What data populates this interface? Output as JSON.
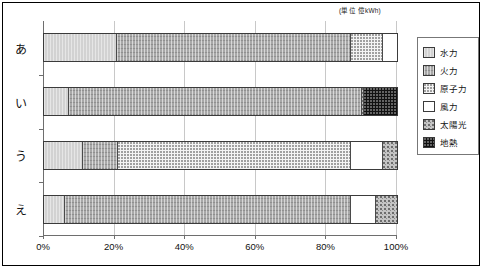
{
  "unit_caption": "(単位  億kWh)",
  "legend": {
    "items": [
      {
        "label": "水力",
        "key": "hydro"
      },
      {
        "label": "火力",
        "key": "thermal"
      },
      {
        "label": "原子力",
        "key": "nuclear"
      },
      {
        "label": "風力",
        "key": "wind"
      },
      {
        "label": "太陽光",
        "key": "solar"
      },
      {
        "label": "地熱",
        "key": "geothermal"
      }
    ]
  },
  "chart_data": {
    "type": "bar",
    "orientation": "horizontal",
    "stacked": true,
    "normalized": true,
    "title": "",
    "subtitle": "",
    "xlabel": "",
    "ylabel": "",
    "unit": "(単位  億kWh)",
    "xlim": [
      0,
      100
    ],
    "xticks": [
      0,
      20,
      40,
      60,
      80,
      100
    ],
    "xtick_labels": [
      "0%",
      "20%",
      "40%",
      "60%",
      "80%",
      "100%"
    ],
    "grid": true,
    "legend_position": "right",
    "categories": [
      "あ",
      "い",
      "う",
      "え"
    ],
    "series": [
      {
        "name": "水力",
        "key": "hydro",
        "values": [
          20.7,
          7.0,
          11.0,
          6.0
        ]
      },
      {
        "name": "火力",
        "key": "thermal",
        "values": [
          66.3,
          83.0,
          10.0,
          81.0
        ]
      },
      {
        "name": "原子力",
        "key": "nuclear",
        "values": [
          9.0,
          0.0,
          66.0,
          0.0
        ]
      },
      {
        "name": "風力",
        "key": "wind",
        "values": [
          4.0,
          0.0,
          9.0,
          7.0
        ]
      },
      {
        "name": "太陽光",
        "key": "solar",
        "values": [
          0.0,
          0.6,
          4.0,
          6.0
        ]
      },
      {
        "name": "地熱",
        "key": "geothermal",
        "values": [
          0.0,
          9.4,
          0.0,
          0.0
        ]
      }
    ],
    "bars": [
      {
        "category": "あ",
        "segments": [
          {
            "key": "hydro",
            "label": "水力",
            "start": 0.0,
            "end": 20.7,
            "value": 20.7
          },
          {
            "key": "thermal",
            "label": "火力",
            "start": 20.7,
            "end": 87.0,
            "value": 66.3
          },
          {
            "key": "nuclear",
            "label": "原子力",
            "start": 87.0,
            "end": 96.0,
            "value": 9.0
          },
          {
            "key": "wind",
            "label": "風力",
            "start": 96.0,
            "end": 100.0,
            "value": 4.0
          }
        ]
      },
      {
        "category": "い",
        "segments": [
          {
            "key": "hydro",
            "label": "水力",
            "start": 0.0,
            "end": 7.0,
            "value": 7.0
          },
          {
            "key": "thermal",
            "label": "火力",
            "start": 7.0,
            "end": 90.0,
            "value": 83.0
          },
          {
            "key": "solar",
            "label": "太陽光",
            "start": 90.0,
            "end": 90.6,
            "value": 0.6
          },
          {
            "key": "geothermal",
            "label": "地熱",
            "start": 90.6,
            "end": 100.0,
            "value": 9.4
          }
        ]
      },
      {
        "category": "う",
        "segments": [
          {
            "key": "hydro",
            "label": "水力",
            "start": 0.0,
            "end": 11.0,
            "value": 11.0
          },
          {
            "key": "thermal",
            "label": "火力",
            "start": 11.0,
            "end": 21.0,
            "value": 10.0
          },
          {
            "key": "nuclear",
            "label": "原子力",
            "start": 21.0,
            "end": 87.0,
            "value": 66.0
          },
          {
            "key": "wind",
            "label": "風力",
            "start": 87.0,
            "end": 96.0,
            "value": 9.0
          },
          {
            "key": "solar",
            "label": "太陽光",
            "start": 96.0,
            "end": 100.0,
            "value": 4.0
          }
        ]
      },
      {
        "category": "え",
        "segments": [
          {
            "key": "hydro",
            "label": "水力",
            "start": 0.0,
            "end": 6.0,
            "value": 6.0
          },
          {
            "key": "thermal",
            "label": "火力",
            "start": 6.0,
            "end": 87.0,
            "value": 81.0
          },
          {
            "key": "wind",
            "label": "風力",
            "start": 87.0,
            "end": 94.0,
            "value": 7.0
          },
          {
            "key": "solar",
            "label": "太陽光",
            "start": 94.0,
            "end": 100.0,
            "value": 6.0
          }
        ]
      }
    ]
  }
}
